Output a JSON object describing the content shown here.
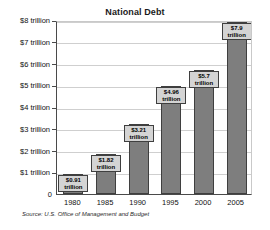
{
  "chart_data": {
    "type": "bar",
    "title": "National Debt",
    "xlabel": "",
    "ylabel": "",
    "categories": [
      "1980",
      "1985",
      "1990",
      "1995",
      "2000",
      "2005"
    ],
    "values": [
      0.91,
      1.82,
      3.21,
      4.96,
      5.7,
      7.9
    ],
    "value_labels": [
      "$0.91\ntrillion",
      "$1.82\ntrillion",
      "$3.21\ntrillion",
      "$4.96\ntrillion",
      "$5.7\ntrillion",
      "$7.9\ntrillion"
    ],
    "ylim": [
      0,
      8
    ],
    "ytick_values": [
      0,
      1,
      2,
      3,
      4,
      5,
      6,
      7,
      8
    ],
    "ytick_labels": [
      "0",
      "$1 trillion",
      "$2 trillion",
      "$3 trillion",
      "$4 trillion",
      "$5 trillion",
      "$6 trillion",
      "$7 trillion",
      "$8 trillion"
    ],
    "grid": true,
    "legend": false,
    "bar_color": "#7e7e7e",
    "bar_edge_color": "#3f3f3f",
    "label_box_color": "#d4d4d4",
    "gridline_color": "#cfcfcf",
    "axis_color": "#4a4a4a",
    "background": "#ffffff"
  },
  "source": {
    "note": "Source: U.S. Office of Management and Budget"
  }
}
